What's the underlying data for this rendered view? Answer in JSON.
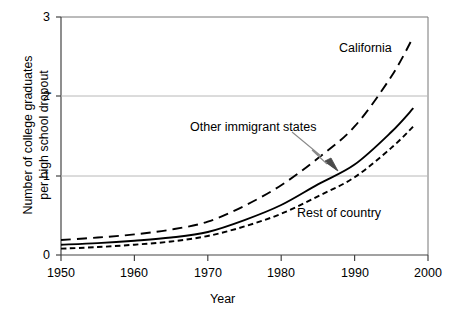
{
  "chart_data": {
    "type": "line",
    "title": "",
    "xlabel": "Year",
    "ylabel": "Number of college graduates per high school dropout",
    "ylabel_lines": [
      "Number of college graduates",
      "per high school dropout"
    ],
    "xlim": [
      1950,
      2000
    ],
    "ylim": [
      0,
      3
    ],
    "xticks": [
      1950,
      1960,
      1970,
      1980,
      1990,
      2000
    ],
    "xtick_labels": [
      "1950",
      "1960",
      "1970",
      "1980",
      "1990",
      "2000"
    ],
    "yticks": [
      0,
      1,
      2,
      3
    ],
    "ytick_labels": [
      "0",
      "1",
      "2",
      "3"
    ],
    "grid": "horizontal gridlines at y = 1 and y = 2",
    "legend_position": "inline annotations on plot",
    "series": [
      {
        "name": "California",
        "style": "long-dashed",
        "color": "#000000",
        "x": [
          1950,
          1955,
          1960,
          1965,
          1970,
          1975,
          1980,
          1985,
          1990,
          1995,
          1998
        ],
        "values": [
          0.19,
          0.22,
          0.26,
          0.32,
          0.42,
          0.62,
          0.88,
          1.22,
          1.62,
          2.25,
          2.75
        ]
      },
      {
        "name": "Other immigrant states",
        "style": "solid",
        "color": "#000000",
        "x": [
          1950,
          1955,
          1960,
          1965,
          1970,
          1975,
          1980,
          1985,
          1990,
          1995,
          1998
        ],
        "values": [
          0.13,
          0.15,
          0.18,
          0.22,
          0.29,
          0.44,
          0.63,
          0.89,
          1.14,
          1.55,
          1.85
        ]
      },
      {
        "name": "Rest of country",
        "style": "short-dashed",
        "color": "#000000",
        "x": [
          1950,
          1955,
          1960,
          1965,
          1970,
          1975,
          1980,
          1985,
          1990,
          1995,
          1998
        ],
        "values": [
          0.08,
          0.1,
          0.13,
          0.17,
          0.24,
          0.36,
          0.52,
          0.74,
          0.98,
          1.35,
          1.62
        ]
      }
    ],
    "annotations": [
      {
        "text": "California",
        "x": 1990.5,
        "y": 2.41
      },
      {
        "text": "Other immigrant states",
        "x": 1974.5,
        "y": 1.52,
        "has_arrow": true
      },
      {
        "text": "Rest of country",
        "x": 1982.5,
        "y": 0.54
      }
    ]
  },
  "axes": {
    "x_title": "Year",
    "y_title_line1": "Number of college graduates",
    "y_title_line2": "per high school dropout",
    "ytick_0": "0",
    "ytick_1": "1",
    "ytick_2": "2",
    "ytick_3": "3",
    "xtick_1950": "1950",
    "xtick_1960": "1960",
    "xtick_1970": "1970",
    "xtick_1980": "1980",
    "xtick_1990": "1990",
    "xtick_2000": "2000"
  },
  "labels": {
    "california": "California",
    "other_immigrant_states": "Other immigrant states",
    "rest_of_country": "Rest of country"
  },
  "colors": {
    "line": "#000000",
    "grid": "#b8b8b8",
    "axis": "#555555",
    "arrow": "#7a7a7a",
    "background": "#ffffff"
  }
}
